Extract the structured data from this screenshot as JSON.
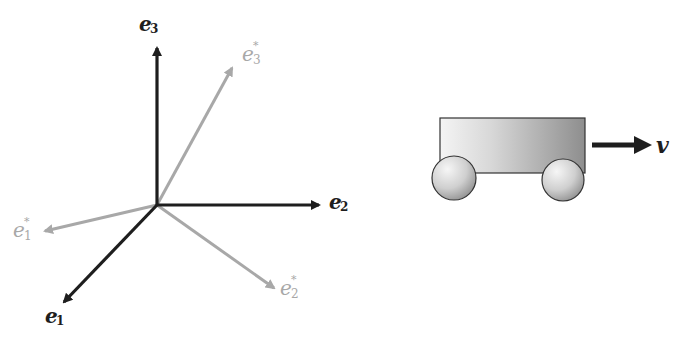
{
  "diagram": {
    "left_figure": {
      "description": "Basis vectors and reciprocal (dual) basis vectors",
      "basis": [
        {
          "id": "e1",
          "label": "e",
          "index": "1",
          "tip": [
            62,
            305
          ]
        },
        {
          "id": "e2",
          "label": "e",
          "index": "2",
          "tip": [
            322,
            205
          ]
        },
        {
          "id": "e3",
          "label": "e",
          "index": "3",
          "tip": [
            157,
            45
          ]
        }
      ],
      "dual_basis": [
        {
          "id": "e1_star",
          "label": "e",
          "index": "1",
          "star": "*",
          "tip": [
            42,
            232
          ]
        },
        {
          "id": "e2_star",
          "label": "e",
          "index": "2",
          "star": "*",
          "tip": [
            277,
            290
          ]
        },
        {
          "id": "e3_star",
          "label": "e",
          "index": "3",
          "star": "*",
          "tip": [
            234,
            65
          ]
        }
      ],
      "origin": [
        157,
        205
      ],
      "colors": {
        "basis": "#1e1e1e",
        "dual": "#a8a8a8"
      }
    },
    "right_figure": {
      "description": "Cart moving with velocity v",
      "velocity_label": "v",
      "colors": {
        "body_light": "#f2f2f2",
        "body_dark": "#9a9a9a",
        "outline": "#333333"
      }
    }
  }
}
